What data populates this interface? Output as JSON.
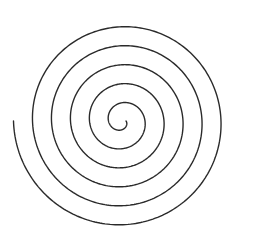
{
  "figure": {
    "type": "archimedean-spiral",
    "width": 256,
    "height": 248,
    "background": "#ffffff",
    "stroke_color": "#2a2a2a",
    "stroke_width": 1.4,
    "center": [
      122,
      121
    ],
    "start_radius": 4,
    "spacing_per_turn": 19,
    "start_angle_deg": 0,
    "turns": 5.5,
    "direction": "clockwise-outward",
    "end_point": [
      244,
      123
    ]
  }
}
